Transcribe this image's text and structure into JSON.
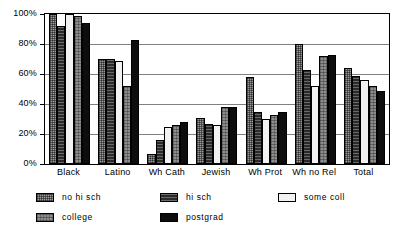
{
  "chart_data": {
    "type": "bar",
    "title": "",
    "xlabel": "",
    "ylabel": "",
    "ylim": [
      0,
      100
    ],
    "yticks": [
      "0%",
      "20%",
      "40%",
      "60%",
      "80%",
      "100%"
    ],
    "ytick_values": [
      0,
      20,
      40,
      60,
      80,
      100
    ],
    "grid": true,
    "legend_position": "bottom",
    "categories": [
      "Black",
      "Latino",
      "Wh Cath",
      "Jewish",
      "Wh Prot",
      "Wh no Rel",
      "Total"
    ],
    "series": [
      {
        "name": "no hi sch",
        "values": [
          100,
          70,
          7,
          31,
          58,
          80,
          64
        ]
      },
      {
        "name": "hi sch",
        "values": [
          92,
          70,
          16,
          27,
          35,
          63,
          59
        ]
      },
      {
        "name": "some coll",
        "values": [
          100,
          69,
          25,
          26,
          30,
          52,
          56
        ]
      },
      {
        "name": "college",
        "values": [
          99,
          52,
          26,
          38,
          33,
          72,
          52
        ]
      },
      {
        "name": "postgrad",
        "values": [
          94,
          83,
          28,
          38,
          35,
          73,
          49
        ]
      }
    ]
  },
  "legend": {
    "entries": [
      {
        "label": "no hi sch"
      },
      {
        "label": "hi sch"
      },
      {
        "label": "some coll"
      },
      {
        "label": "college"
      },
      {
        "label": "postgrad"
      }
    ]
  },
  "colors": {
    "no_hi_sch": "#9a9a9a",
    "hi_sch": "#2a2a2a",
    "some_coll": "#f2f2f2",
    "college": "#8c8c8c",
    "postgrad": "#0d0d0d",
    "axis": "#000000",
    "grid": "#808080",
    "background": "#ffffff"
  }
}
